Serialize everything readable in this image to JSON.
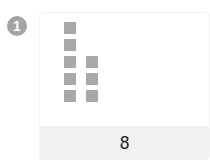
{
  "item": {
    "number": "1",
    "answer": "8",
    "blocks": {
      "columns": [
        5,
        3
      ],
      "total": 8,
      "color": "#a9a9a9"
    }
  }
}
